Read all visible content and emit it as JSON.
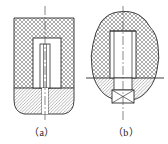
{
  "figure": {
    "type": "mechanical-drawing",
    "background_color": "#ffffff",
    "line_color": "#2b2b2b",
    "hatch_color_cross": "#7a7a7a",
    "hatch_color_diagonal": "#8a8a8a",
    "centerline_color": "#555555",
    "panels": [
      {
        "id": "a",
        "caption": "（a）",
        "outline": "rounded-rectangular block, vertical section",
        "parts": [
          {
            "name": "upper-body-cross-hatched",
            "hatch": "cross"
          },
          {
            "name": "lower-body-diagonal-hatched",
            "hatch": "diagonal"
          },
          {
            "name": "counterbore-recess",
            "hatch": "none"
          },
          {
            "name": "screw-shank",
            "hatch": "none"
          },
          {
            "name": "vertical-centerline",
            "hatch": "none"
          }
        ]
      },
      {
        "id": "b",
        "caption": "（b）",
        "outline": "irregular break-line boundary, vertical section",
        "parts": [
          {
            "name": "upper-body-cross-hatched",
            "hatch": "cross"
          },
          {
            "name": "lower-body-diagonal-hatched",
            "hatch": "diagonal"
          },
          {
            "name": "threaded-bore",
            "hatch": "none"
          },
          {
            "name": "stud-shank",
            "hatch": "none"
          },
          {
            "name": "nut-with-cross-mark",
            "hatch": "none"
          },
          {
            "name": "vertical-centerline",
            "hatch": "none"
          },
          {
            "name": "horizontal-centerline",
            "hatch": "none"
          }
        ]
      }
    ]
  },
  "captions": {
    "a": "（a）",
    "b": "（b）"
  }
}
